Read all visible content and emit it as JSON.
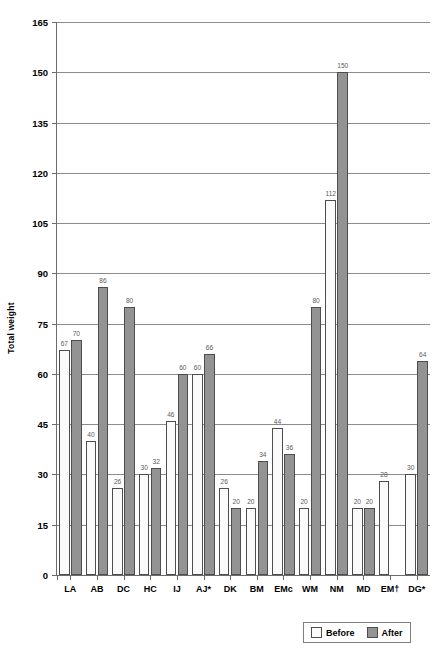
{
  "chart_data": {
    "type": "bar",
    "title": "",
    "xlabel": "",
    "ylabel": "Total weight",
    "ylim": [
      0,
      165
    ],
    "ytick_step": 15,
    "yticks": [
      0,
      15,
      30,
      45,
      60,
      75,
      90,
      105,
      120,
      135,
      150,
      165
    ],
    "grid": true,
    "legend_position": "bottom-right",
    "categories": [
      "LA",
      "AB",
      "DC",
      "HC",
      "IJ",
      "AJ*",
      "DK",
      "BM",
      "EMc",
      "WM",
      "NM",
      "MD",
      "EM†",
      "DG*"
    ],
    "series": [
      {
        "name": "Before",
        "color": "#fbfbfb",
        "values": [
          67,
          40,
          26,
          30,
          46,
          60,
          26,
          20,
          44,
          20,
          112,
          20,
          28,
          30
        ]
      },
      {
        "name": "After",
        "color": "#939393",
        "values": [
          70,
          86,
          80,
          32,
          60,
          66,
          20,
          34,
          36,
          80,
          150,
          20,
          null,
          64
        ]
      }
    ],
    "data_labels": {
      "Before": [
        "67",
        "40",
        "26",
        "30",
        "46",
        "60",
        "26",
        "20",
        "44",
        "20",
        "112",
        "20",
        "28",
        "30"
      ],
      "After": [
        "70",
        "86",
        "80",
        "32",
        "60",
        "66",
        "20",
        "34",
        "36",
        "80",
        "150",
        "20",
        "",
        "64"
      ]
    }
  },
  "legend": {
    "items": [
      {
        "label": "Before",
        "swatch": "before"
      },
      {
        "label": "After",
        "swatch": "after"
      }
    ]
  }
}
